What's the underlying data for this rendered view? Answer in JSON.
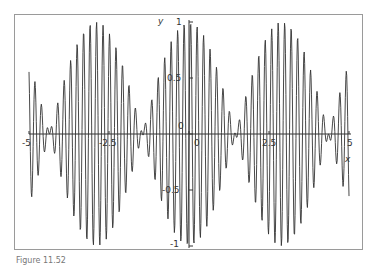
{
  "chart_data": {
    "type": "line",
    "title": "",
    "xlabel": "x",
    "ylabel": "y",
    "xlim": [
      -5,
      5
    ],
    "ylim": [
      -1,
      1
    ],
    "grid": false,
    "legend": null,
    "x_ticks": [
      -5,
      -2.5,
      0,
      2.5,
      5
    ],
    "x_tick_labels": [
      "-5",
      "-2.5",
      "0",
      "2.5",
      "5"
    ],
    "y_ticks": [
      -1,
      -0.5,
      0,
      0.5,
      1
    ],
    "y_tick_labels": [
      "-1",
      "-0.5",
      "0",
      "0.5",
      "1"
    ],
    "series": [
      {
        "name": "y",
        "description": "amplitude-modulated oscillation: y = cos(1.08 x) * sin(31 x)",
        "envelope_frequency": 1.08,
        "carrier_frequency": 31,
        "envelope_nodes_x": [
          -4.35,
          -1.45,
          1.45,
          4.35
        ],
        "envelope_peaks_x": [
          -2.9,
          0,
          2.9
        ],
        "color": "#333333"
      }
    ]
  },
  "caption": "Figure 11.52"
}
